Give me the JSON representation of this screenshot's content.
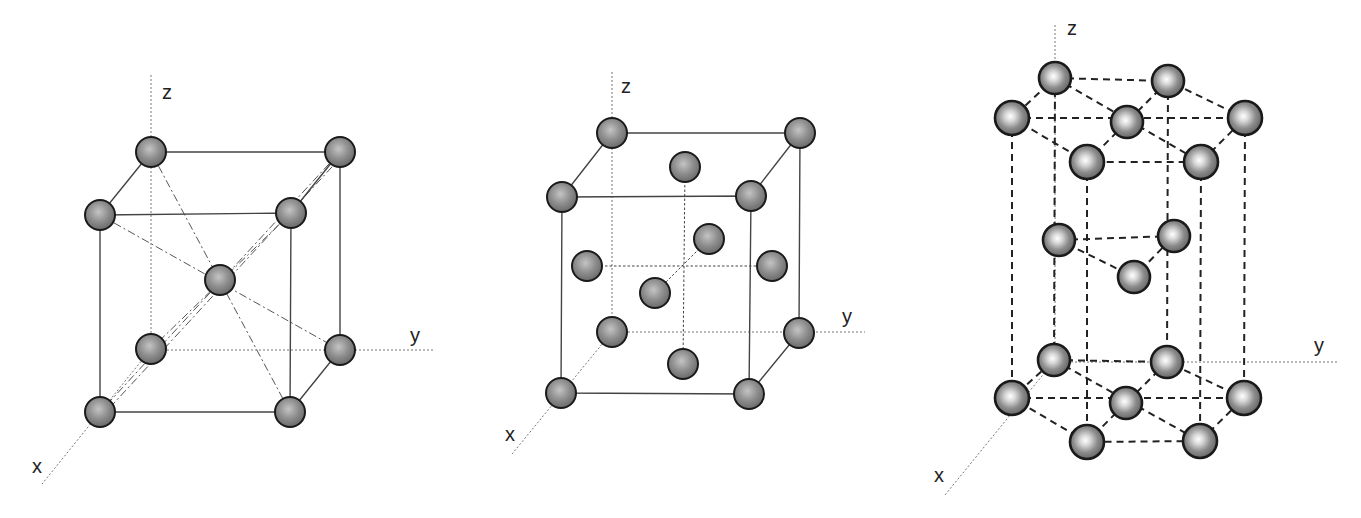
{
  "figure": {
    "panels": [
      {
        "id": "bcc",
        "name": "Body-centered cubic",
        "axes": {
          "x": "x",
          "y": "y",
          "z": "z"
        },
        "atom_count": 9
      },
      {
        "id": "fcc",
        "name": "Face-centered cubic",
        "axes": {
          "x": "x",
          "y": "y",
          "z": "z"
        },
        "atom_count": 14
      },
      {
        "id": "hcp",
        "name": "Hexagonal close-packed",
        "axes": {
          "x": "x",
          "y": "y",
          "z": "z"
        },
        "atom_count": 17
      }
    ],
    "colors": {
      "atom_fill": "#8a8a8a",
      "atom_outline": "#1a1a1a",
      "edge": "#444444",
      "axis": "#777777"
    }
  }
}
